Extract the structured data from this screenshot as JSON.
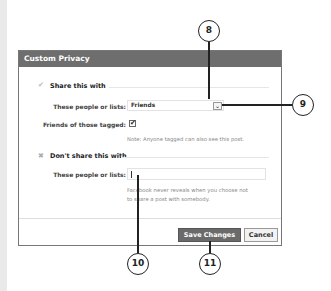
{
  "dialog": {
    "title": "Custom Privacy",
    "share_section": {
      "title": "Share this with",
      "people_label": "These people or lists:",
      "people_value": "Friends",
      "tagged_label": "Friends of those tagged:",
      "tagged_checked": true,
      "tagged_check_glyph": "✔",
      "note": "Note: Anyone tagged can also see this post."
    },
    "dont_share_section": {
      "title": "Don't share this with",
      "people_label": "These people or lists:",
      "people_value": "",
      "info_line1": "Facebook never reveals when you choose not",
      "info_line2": "to share a post with somebody."
    },
    "buttons": {
      "save": "Save Changes",
      "cancel": "Cancel"
    }
  },
  "icons": {
    "check": "✔",
    "x": "✖",
    "dropdown": "⌄"
  },
  "callouts": {
    "c8": "8",
    "c9": "9",
    "c10": "10",
    "c11": "11"
  },
  "colors": {
    "header_bg": "#6e6e6e",
    "primary_button_bg": "#6a6a6a"
  }
}
